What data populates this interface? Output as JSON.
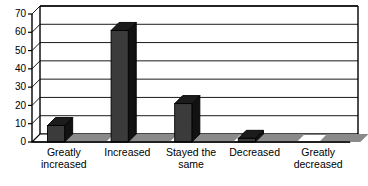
{
  "chart_data": {
    "type": "bar",
    "title": "",
    "subtitle": "",
    "xlabel": "",
    "ylabel": "",
    "categories": [
      "Greatly increased",
      "Increased",
      "Stayed the same",
      "Decreased",
      "Greatly decreased"
    ],
    "category_lines": [
      [
        "Greatly",
        "increased"
      ],
      [
        "Increased"
      ],
      [
        "Stayed the",
        "same"
      ],
      [
        "Decreased"
      ],
      [
        "Greatly",
        "decreased"
      ]
    ],
    "values": [
      9,
      61,
      21,
      2,
      0
    ],
    "ylim": [
      0,
      70
    ],
    "ytick_labels": [
      "0",
      "10",
      "20",
      "30",
      "40",
      "50",
      "60",
      "70"
    ],
    "ytick_values": [
      0,
      10,
      20,
      30,
      40,
      50,
      60,
      70
    ],
    "grid": true,
    "grid_axis": "y",
    "legend": "none",
    "style": "3d-column",
    "colors": {
      "bar_front": "#3b3b3b",
      "bar_top": "#1c1c1c",
      "bar_side": "#121212",
      "axis": "#000000",
      "grid": "#000000",
      "background": "#ffffff",
      "floor": "#8a8a8a"
    }
  }
}
